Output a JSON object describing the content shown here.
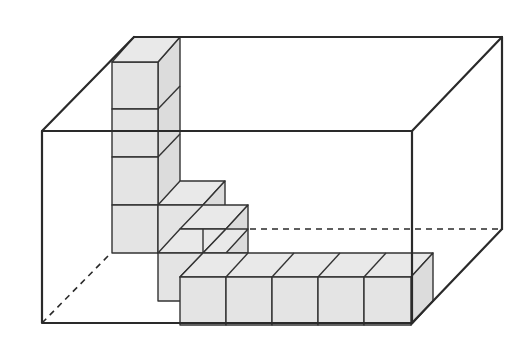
{
  "figure": {
    "type": "isometric-oblique box with unit cubes",
    "box": {
      "front_face": {
        "x1": 42,
        "y1": 131,
        "x2": 412,
        "y2": 323
      },
      "depth_offset": {
        "dx": 92,
        "dy": -94
      },
      "hidden_edges": [
        "back-bottom-left vertical to bottom",
        "back bottom edge",
        "back bottom-left diagonal"
      ]
    },
    "cube_groups": {
      "vertical_column_cubes": 4,
      "stair_cubes": 3,
      "front_row_cubes": 5
    },
    "colors": {
      "edge": "#2a2a2a",
      "cube_fill": "#e4e4e4",
      "background": "#ffffff"
    }
  }
}
